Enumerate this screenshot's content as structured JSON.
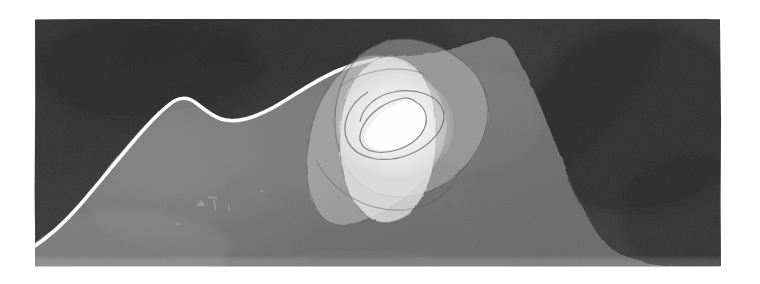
{
  "artwork": {
    "title": "Abstract Monochrome Landscape with Nested Rounded Forms",
    "medium": "watercolor and gouache on paper",
    "palette_description": "monochrome grisaille, dark charcoal ground with mid-grey mound and luminous white core",
    "signature": {
      "present": "yes",
      "text": "Klee",
      "position": "lower right",
      "legibility": "faint pencil, barely legible"
    },
    "canvas": {
      "width": 760,
      "height": 284,
      "background": "#ffffff"
    },
    "plate": {
      "x": 34,
      "y": 18,
      "width": 688,
      "height": 250,
      "label": "paper sheet"
    },
    "colors": {
      "paper_white": "#ffffff",
      "ground_dark": "#3b3b3b",
      "ground_dark_deep": "#2f2f2f",
      "ground_dark_soft": "#454545",
      "mound_mid": "#787878",
      "mound_light": "#8a8a8a",
      "mound_shadow": "#6c6c6c",
      "shape_outer": "#8e8e8e",
      "shape_mid": "#a3a3a3",
      "shape_inner": "#d8d8d8",
      "shape_core": "#f2f2f2",
      "highlight_line": "#f6f6f6",
      "contour_line": "#6a6a6a",
      "signature_ink": "#5a5a5a"
    },
    "elements": [
      {
        "name": "dark-ground",
        "description": "Deep charcoal wash filling the upper field and both upper corners"
      },
      {
        "name": "mound",
        "description": "Large mid-grey rounded hill rising from the lower left, cresting near centre-left and sloping down to the lower right"
      },
      {
        "name": "ridge-highlight-line",
        "description": "Thin luminous white contour tracing the left flank and crest of the mound"
      },
      {
        "name": "shape-outer-rounded-triangle",
        "description": "Large translucent rounded triangle, apex up-left, overlapping the mound crest"
      },
      {
        "name": "shape-mid-rounded-triangle",
        "description": "Second translucent rounded triangle rotated clockwise, apex up-right"
      },
      {
        "name": "shape-inner-oval",
        "description": "Pale vertical oval / lozenge nested inside the triangles"
      },
      {
        "name": "shape-core-triangle",
        "description": "Small bright white rounded triangle at the very centre of the cluster"
      },
      {
        "name": "contour-loop",
        "description": "Thin drawn loop curving through the luminous core"
      }
    ],
    "annotations": {
      "faint_marks_label": "faint scratched marks on mound, lower left of centre"
    }
  }
}
